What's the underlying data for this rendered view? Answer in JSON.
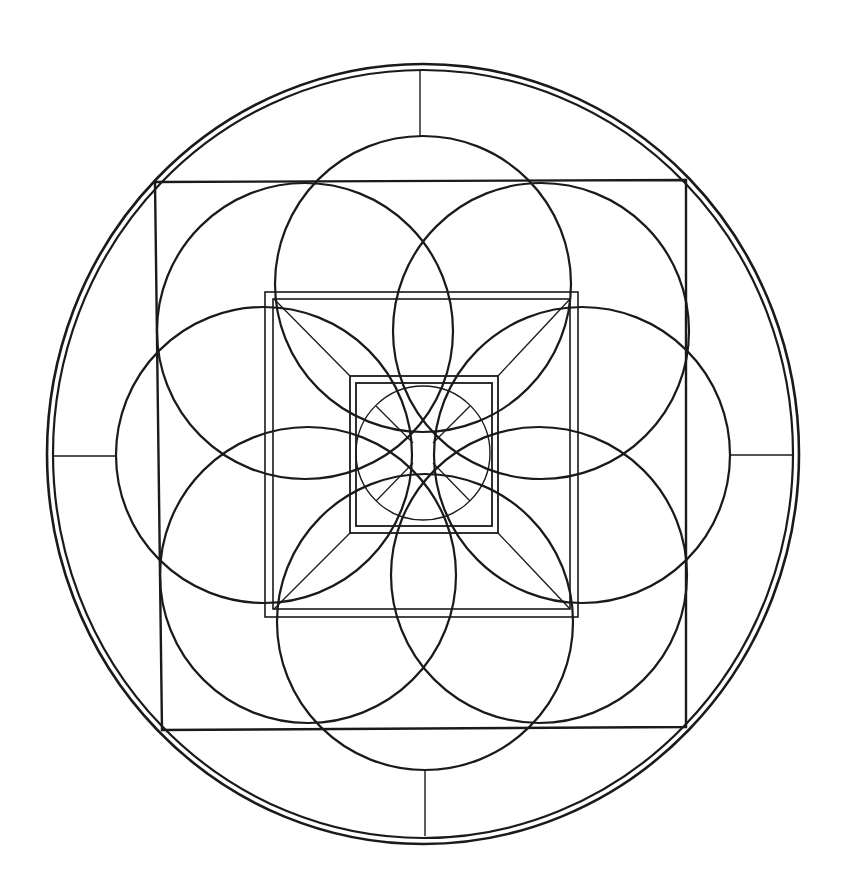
{
  "drawing": {
    "title": "Geometric mandala line drawing",
    "stroke_color": "#1a1a1a",
    "background": "#ffffff",
    "center": [
      423,
      454
    ],
    "outer_ring": {
      "outer": {
        "rx": 376,
        "ry": 390
      },
      "inner": {
        "rx": 370,
        "ry": 384
      }
    },
    "spokes": [
      {
        "x1": 420,
        "y1": 71,
        "x2": 420,
        "y2": 136
      },
      {
        "x1": 425,
        "y1": 771,
        "x2": 425,
        "y2": 836
      },
      {
        "x1": 54,
        "y1": 456,
        "x2": 116,
        "y2": 456
      },
      {
        "x1": 729,
        "y1": 455,
        "x2": 792,
        "y2": 455
      }
    ],
    "big_square": [
      [
        155,
        182
      ],
      [
        686,
        180
      ],
      [
        686,
        727
      ],
      [
        162,
        730
      ]
    ],
    "middle_square_outer": {
      "x": 265,
      "y": 292,
      "w": 313,
      "h": 325
    },
    "middle_square_inner": {
      "x": 273,
      "y": 299,
      "w": 297,
      "h": 310
    },
    "inner_square_outer": {
      "x": 350,
      "y": 376,
      "w": 148,
      "h": 157
    },
    "inner_square_inner": {
      "x": 356,
      "y": 383,
      "w": 136,
      "h": 143
    },
    "corner_diagonals": [
      {
        "x1": 274,
        "y1": 299,
        "x2": 350,
        "y2": 376
      },
      {
        "x1": 570,
        "y1": 299,
        "x2": 498,
        "y2": 376
      },
      {
        "x1": 274,
        "y1": 609,
        "x2": 350,
        "y2": 533
      },
      {
        "x1": 570,
        "y1": 609,
        "x2": 498,
        "y2": 533
      }
    ],
    "petal_circles": [
      {
        "cx": 423,
        "cy": 284,
        "r": 148
      },
      {
        "cx": 541,
        "cy": 331,
        "r": 148
      },
      {
        "cx": 582,
        "cy": 455,
        "r": 148
      },
      {
        "cx": 539,
        "cy": 575,
        "r": 148
      },
      {
        "cx": 425,
        "cy": 622,
        "r": 148
      },
      {
        "cx": 308,
        "cy": 575,
        "r": 148
      },
      {
        "cx": 264,
        "cy": 455,
        "r": 148
      },
      {
        "cx": 305,
        "cy": 331,
        "r": 148
      }
    ],
    "central_circle": {
      "cx": 423,
      "cy": 453,
      "r": 67
    },
    "central_rays": [
      {
        "x1": 376,
        "y1": 406,
        "x2": 413,
        "y2": 443
      },
      {
        "x1": 470,
        "y1": 406,
        "x2": 433,
        "y2": 443
      },
      {
        "x1": 376,
        "y1": 501,
        "x2": 413,
        "y2": 463
      },
      {
        "x1": 470,
        "y1": 501,
        "x2": 433,
        "y2": 463
      }
    ],
    "center_dot": {
      "cx": 423,
      "cy": 453,
      "r": 1.6
    }
  }
}
